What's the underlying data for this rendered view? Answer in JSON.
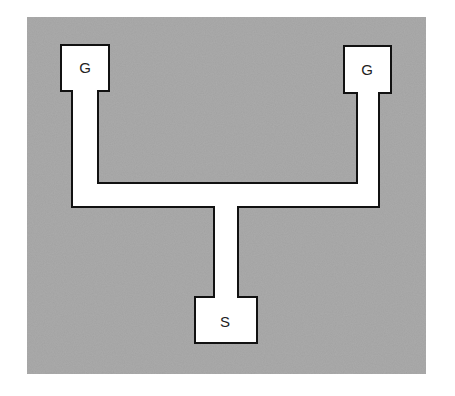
{
  "diagram": {
    "background_color": "#a2a2a2",
    "trace_color": "#ffffff",
    "outline_color": "#111111",
    "pads": [
      {
        "id": "gate-left",
        "label": "G"
      },
      {
        "id": "gate-right",
        "label": "G"
      },
      {
        "id": "source",
        "label": "S"
      }
    ]
  }
}
